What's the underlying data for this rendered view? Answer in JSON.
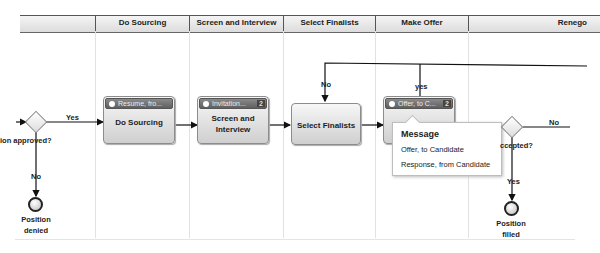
{
  "lanes": [
    {
      "label": ""
    },
    {
      "label": "Do Sourcing"
    },
    {
      "label": "Screen and Interview"
    },
    {
      "label": "Select Finalists"
    },
    {
      "label": "Make Offer"
    },
    {
      "label": "Renego"
    }
  ],
  "gateways": {
    "approval": {
      "label": "ion approved?",
      "yes_label": "Yes",
      "no_label": "No"
    },
    "accepted": {
      "label": "ccepted?",
      "yes_label": "Yes",
      "no_label": "No"
    }
  },
  "loop_labels": {
    "no": "No",
    "yes": "yes"
  },
  "tasks": [
    {
      "label_line1": "Do Sourcing",
      "label_line2": "",
      "message": "Resume, fro...",
      "count": ""
    },
    {
      "label_line1": "Screen and",
      "label_line2": "Interview",
      "message": "Invitation...",
      "count": "2"
    },
    {
      "label_line1": "Select Finalists",
      "label_line2": "",
      "message": "",
      "count": ""
    },
    {
      "label_line1": "",
      "label_line2": "",
      "message": "Offer, to C...",
      "count": "2"
    }
  ],
  "end_events": {
    "denied": {
      "line1": "Position",
      "line2": "denied"
    },
    "filled": {
      "line1": "Position",
      "line2": "filled"
    }
  },
  "tooltip": {
    "title": "Message",
    "items": [
      "Offer, to Candidate",
      "Response, from Candidate"
    ]
  }
}
